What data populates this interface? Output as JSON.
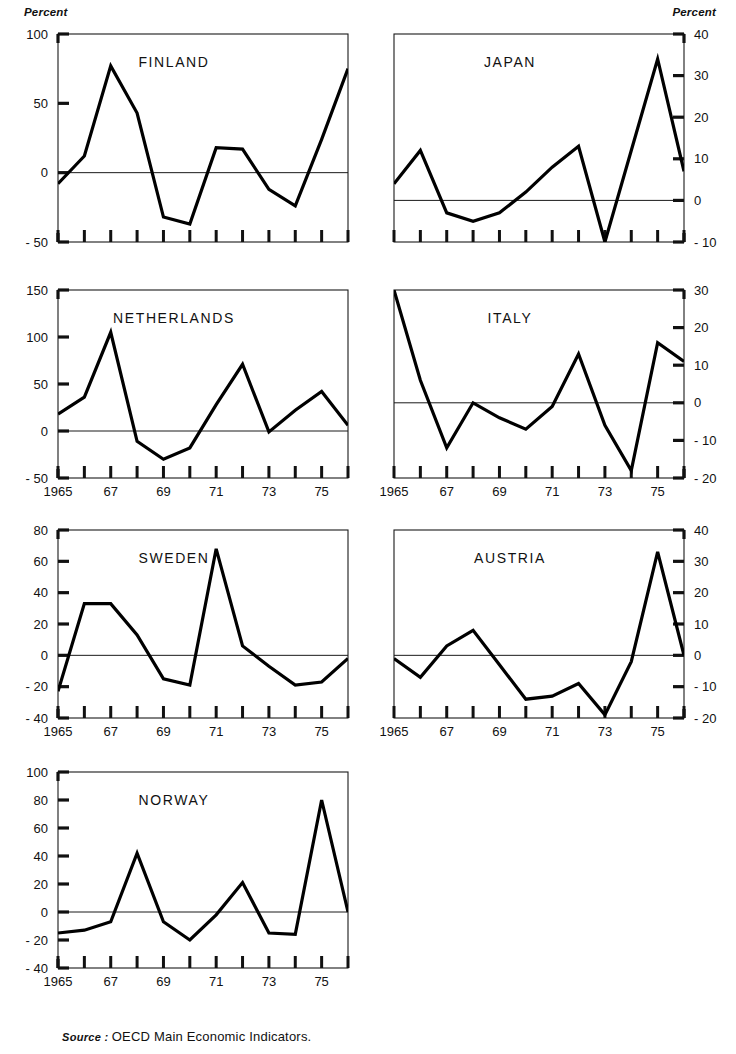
{
  "figure": {
    "clipped_title": "",
    "percent_label_left": "Percent",
    "percent_label_right": "Percent",
    "source_prefix": "Source :",
    "source_text": "OECD Main Economic Indicators."
  },
  "chart_data": [
    {
      "type": "line",
      "title": "FINLAND",
      "panel": "top-left",
      "xlabel": "",
      "ylabel": "Percent",
      "ylim": [
        -50,
        100
      ],
      "yticks": [
        -50,
        0,
        50,
        100
      ],
      "ytick_labels": [
        "- 50",
        "0",
        "50",
        "100"
      ],
      "y_axis_side": "left",
      "xlim": [
        1965,
        1976
      ],
      "xticks": [
        1965,
        1966,
        1967,
        1968,
        1969,
        1970,
        1971,
        1972,
        1973,
        1974,
        1975,
        1976
      ],
      "xtick_labels": [
        "1965",
        "",
        "67",
        "",
        "69",
        "",
        "71",
        "",
        "73",
        "",
        "75",
        ""
      ],
      "grid": false,
      "zero_line": true,
      "x": [
        1965,
        1966,
        1967,
        1968,
        1969,
        1970,
        1971,
        1972,
        1973,
        1974,
        1975,
        1976
      ],
      "values": [
        -8,
        12,
        77,
        43,
        -32,
        -37,
        18,
        17,
        -12,
        -24,
        24,
        75
      ]
    },
    {
      "type": "line",
      "title": "JAPAN",
      "panel": "top-right",
      "xlabel": "",
      "ylabel": "Percent",
      "ylim": [
        -10,
        40
      ],
      "yticks": [
        -10,
        0,
        10,
        20,
        30,
        40
      ],
      "ytick_labels": [
        "- 10",
        "0",
        "10",
        "20",
        "30",
        "40"
      ],
      "y_axis_side": "right",
      "xlim": [
        1965,
        1976
      ],
      "xticks": [
        1965,
        1966,
        1967,
        1968,
        1969,
        1970,
        1971,
        1972,
        1973,
        1974,
        1975,
        1976
      ],
      "xtick_labels": [
        "1965",
        "",
        "67",
        "",
        "69",
        "",
        "71",
        "",
        "73",
        "",
        "75",
        ""
      ],
      "grid": false,
      "zero_line": true,
      "x": [
        1965,
        1966,
        1967,
        1968,
        1969,
        1970,
        1971,
        1972,
        1973,
        1974,
        1975,
        1976
      ],
      "values": [
        4,
        12,
        -3,
        -5,
        -3,
        2,
        8,
        13,
        -10,
        12,
        34,
        7
      ]
    },
    {
      "type": "line",
      "title": "NETHERLANDS",
      "panel": "mid-left",
      "xlabel": "",
      "ylabel": "Percent",
      "ylim": [
        -50,
        150
      ],
      "yticks": [
        -50,
        0,
        50,
        100,
        150
      ],
      "ytick_labels": [
        "- 50",
        "0",
        "50",
        "100",
        "150"
      ],
      "y_axis_side": "left",
      "xlim": [
        1965,
        1976
      ],
      "xticks": [
        1965,
        1966,
        1967,
        1968,
        1969,
        1970,
        1971,
        1972,
        1973,
        1974,
        1975,
        1976
      ],
      "xtick_labels": [
        "1965",
        "",
        "67",
        "",
        "69",
        "",
        "71",
        "",
        "73",
        "",
        "75",
        ""
      ],
      "grid": false,
      "zero_line": true,
      "x": [
        1965,
        1966,
        1967,
        1968,
        1969,
        1970,
        1971,
        1972,
        1973,
        1974,
        1975,
        1976
      ],
      "values": [
        18,
        36,
        105,
        -11,
        -30,
        -18,
        28,
        71,
        -1,
        22,
        42,
        6
      ]
    },
    {
      "type": "line",
      "title": "ITALY",
      "panel": "mid-right",
      "xlabel": "",
      "ylabel": "Percent",
      "ylim": [
        -20,
        30
      ],
      "yticks": [
        -20,
        -10,
        0,
        10,
        20,
        30
      ],
      "ytick_labels": [
        "- 20",
        "- 10",
        "0",
        "10",
        "20",
        "30"
      ],
      "y_axis_side": "right",
      "xlim": [
        1965,
        1976
      ],
      "xticks": [
        1965,
        1966,
        1967,
        1968,
        1969,
        1970,
        1971,
        1972,
        1973,
        1974,
        1975,
        1976
      ],
      "xtick_labels": [
        "1965",
        "",
        "67",
        "",
        "69",
        "",
        "71",
        "",
        "73",
        "",
        "75",
        ""
      ],
      "grid": false,
      "zero_line": true,
      "x": [
        1965,
        1966,
        1967,
        1968,
        1969,
        1970,
        1971,
        1972,
        1973,
        1974,
        1975,
        1976
      ],
      "values": [
        30,
        6,
        -12,
        0,
        -4,
        -7,
        -1,
        13,
        -6,
        -18,
        16,
        11
      ]
    },
    {
      "type": "line",
      "title": "SWEDEN",
      "panel": "low-left",
      "xlabel": "",
      "ylabel": "Percent",
      "ylim": [
        -40,
        80
      ],
      "yticks": [
        -40,
        -20,
        0,
        20,
        40,
        60,
        80
      ],
      "ytick_labels": [
        "- 40",
        "- 20",
        "0",
        "20",
        "40",
        "60",
        "80"
      ],
      "y_axis_side": "left",
      "xlim": [
        1965,
        1976
      ],
      "xticks": [
        1965,
        1966,
        1967,
        1968,
        1969,
        1970,
        1971,
        1972,
        1973,
        1974,
        1975,
        1976
      ],
      "xtick_labels": [
        "1965",
        "",
        "67",
        "",
        "69",
        "",
        "71",
        "",
        "73",
        "",
        "75",
        ""
      ],
      "grid": false,
      "zero_line": true,
      "x": [
        1965,
        1966,
        1967,
        1968,
        1969,
        1970,
        1971,
        1972,
        1973,
        1974,
        1975,
        1976
      ],
      "values": [
        -23,
        33,
        33,
        13,
        -15,
        -19,
        68,
        6,
        -7,
        -19,
        -17,
        -2
      ]
    },
    {
      "type": "line",
      "title": "AUSTRIA",
      "panel": "low-right",
      "xlabel": "",
      "ylabel": "Percent",
      "ylim": [
        -20,
        40
      ],
      "yticks": [
        -20,
        -10,
        0,
        10,
        20,
        30,
        40
      ],
      "ytick_labels": [
        "- 20",
        "- 10",
        "0",
        "10",
        "20",
        "30",
        "40"
      ],
      "y_axis_side": "right",
      "xlim": [
        1965,
        1976
      ],
      "xticks": [
        1965,
        1966,
        1967,
        1968,
        1969,
        1970,
        1971,
        1972,
        1973,
        1974,
        1975,
        1976
      ],
      "xtick_labels": [
        "1965",
        "",
        "67",
        "",
        "69",
        "",
        "71",
        "",
        "73",
        "",
        "75",
        ""
      ],
      "grid": false,
      "zero_line": true,
      "x": [
        1965,
        1966,
        1967,
        1968,
        1969,
        1970,
        1971,
        1972,
        1973,
        1974,
        1975,
        1976
      ],
      "values": [
        -1,
        -7,
        3,
        8,
        -3,
        -14,
        -13,
        -9,
        -19,
        -2,
        33,
        0
      ]
    },
    {
      "type": "line",
      "title": "NORWAY",
      "panel": "bottom-left",
      "xlabel": "",
      "ylabel": "Percent",
      "ylim": [
        -40,
        100
      ],
      "yticks": [
        -40,
        -20,
        0,
        20,
        40,
        60,
        80,
        100
      ],
      "ytick_labels": [
        "- 40",
        "- 20",
        "0",
        "20",
        "40",
        "60",
        "80",
        "100"
      ],
      "y_axis_side": "left",
      "xlim": [
        1965,
        1976
      ],
      "xticks": [
        1965,
        1966,
        1967,
        1968,
        1969,
        1970,
        1971,
        1972,
        1973,
        1974,
        1975,
        1976
      ],
      "xtick_labels": [
        "1965",
        "",
        "67",
        "",
        "69",
        "",
        "71",
        "",
        "73",
        "",
        "75",
        ""
      ],
      "grid": false,
      "zero_line": true,
      "x": [
        1965,
        1966,
        1967,
        1968,
        1969,
        1970,
        1971,
        1972,
        1973,
        1974,
        1975,
        1976
      ],
      "values": [
        -15,
        -13,
        -7,
        42,
        -7,
        -20,
        -2,
        21,
        -15,
        -16,
        80,
        0
      ]
    }
  ]
}
